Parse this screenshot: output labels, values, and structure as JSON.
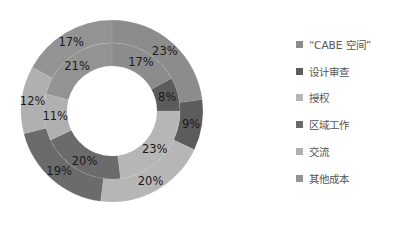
{
  "chart_data": {
    "type": "pie",
    "variant": "double-donut",
    "title": "",
    "categories": [
      "“CABE 空间”",
      "设计审查",
      "授权",
      "区域工作",
      "交流",
      "其他成本"
    ],
    "series": [
      {
        "name": "outer",
        "values": [
          23,
          9,
          20,
          19,
          12,
          17
        ],
        "labels": [
          "23%",
          "9%",
          "20%",
          "19%",
          "12%",
          "17%"
        ]
      },
      {
        "name": "inner",
        "values": [
          17,
          8,
          23,
          20,
          11,
          21
        ],
        "labels": [
          "17%",
          "8%",
          "23%",
          "20%",
          "11%",
          "21%"
        ]
      }
    ],
    "colors": [
      "#8c8c8c",
      "#5c5c5c",
      "#b6b6b6",
      "#6b6b6b",
      "#b0b0b0",
      "#939393"
    ],
    "start_angle": "12 o'clock",
    "direction": "clockwise",
    "legend_position": "right"
  },
  "legend": {
    "items": [
      {
        "label": "“CABE 空间”",
        "color": "#8c8c8c"
      },
      {
        "label": "设计审查",
        "color": "#5c5c5c"
      },
      {
        "label": "授权",
        "color": "#b6b6b6"
      },
      {
        "label": "区域工作",
        "color": "#6b6b6b"
      },
      {
        "label": "交流",
        "color": "#b0b0b0"
      },
      {
        "label": "其他成本",
        "color": "#939393"
      }
    ]
  }
}
